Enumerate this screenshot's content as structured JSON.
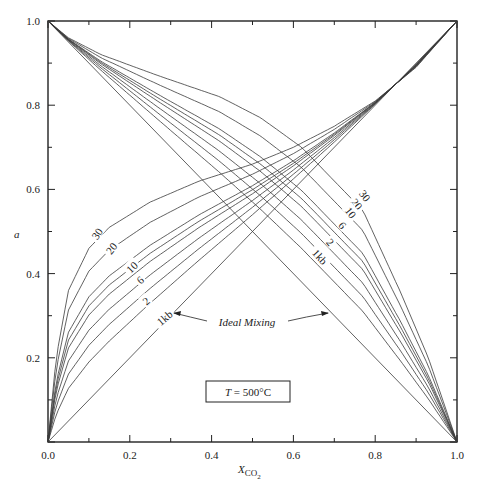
{
  "chart_data": {
    "type": "line",
    "title": "",
    "xlabel": "X_CO2",
    "xlabel_main": "X",
    "xlabel_sub": "CO",
    "xlabel_subsub": "2",
    "ylabel": "a",
    "xlim": [
      0.0,
      1.0
    ],
    "ylim": [
      0.0,
      1.0
    ],
    "x_ticks": [
      "0.0",
      "0.2",
      "0.4",
      "0.6",
      "0.8",
      "1.0"
    ],
    "y_ticks": [
      "0.2",
      "0.4",
      "0.6",
      "0.8",
      "1.0"
    ],
    "grid": false,
    "legend": null,
    "annotations": {
      "ideal_mixing": "Ideal Mixing",
      "temperature_box": "T = 500°C",
      "temperature_var": "T",
      "temperature_value": " = 500°C"
    },
    "ideal_mixing": {
      "ascending": [
        [
          0,
          0
        ],
        [
          1,
          1
        ]
      ],
      "descending": [
        [
          0,
          1
        ],
        [
          1,
          0
        ]
      ]
    },
    "reference_30kb": {
      "ascending": [
        [
          0,
          0
        ],
        [
          0.02,
          0.2
        ],
        [
          0.05,
          0.36
        ],
        [
          0.1,
          0.46
        ],
        [
          0.15,
          0.51
        ],
        [
          0.25,
          0.57
        ],
        [
          0.37,
          0.62
        ],
        [
          0.5,
          0.66
        ],
        [
          0.6,
          0.7
        ],
        [
          0.7,
          0.75
        ],
        [
          0.8,
          0.81
        ],
        [
          0.9,
          0.89
        ],
        [
          1,
          1
        ]
      ],
      "descending": [
        [
          0,
          1
        ],
        [
          0.05,
          0.96
        ],
        [
          0.13,
          0.92
        ],
        [
          0.27,
          0.87
        ],
        [
          0.42,
          0.82
        ],
        [
          0.52,
          0.77
        ],
        [
          0.62,
          0.7
        ],
        [
          0.7,
          0.62
        ],
        [
          0.77,
          0.55
        ],
        [
          0.86,
          0.36
        ],
        [
          0.93,
          0.2
        ],
        [
          1,
          0
        ]
      ]
    },
    "series": [
      {
        "name": "30",
        "pressure_kb": 30,
        "deviation_fraction": 1.0,
        "label": "30"
      },
      {
        "name": "20",
        "pressure_kb": 20,
        "deviation_fraction": 0.85,
        "label": "20"
      },
      {
        "name": "10",
        "pressure_kb": 10,
        "deviation_fraction": 0.68,
        "label": "10"
      },
      {
        "name": "8",
        "pressure_kb": 8,
        "deviation_fraction": 0.62,
        "label": ""
      },
      {
        "name": "6",
        "pressure_kb": 6,
        "deviation_fraction": 0.56,
        "label": "6"
      },
      {
        "name": "4",
        "pressure_kb": 4,
        "deviation_fraction": 0.46,
        "label": ""
      },
      {
        "name": "2",
        "pressure_kb": 2,
        "deviation_fraction": 0.36,
        "label": "2"
      },
      {
        "name": "1kb",
        "pressure_kb": 1,
        "deviation_fraction": 0.25,
        "label": "1kb"
      }
    ],
    "left_labels": [
      {
        "text": "30",
        "x": 0.12,
        "y": 0.495,
        "rot": -55
      },
      {
        "text": "20",
        "x": 0.155,
        "y": 0.46,
        "rot": -52
      },
      {
        "text": "10",
        "x": 0.205,
        "y": 0.415,
        "rot": -45
      },
      {
        "text": "6",
        "x": 0.225,
        "y": 0.385,
        "rot": -42
      },
      {
        "text": "2",
        "x": 0.24,
        "y": 0.335,
        "rot": -40
      },
      {
        "text": "1kb",
        "x": 0.285,
        "y": 0.295,
        "rot": -40
      }
    ],
    "right_labels": [
      {
        "text": "30",
        "x": 0.775,
        "y": 0.585,
        "rot": 52
      },
      {
        "text": "20",
        "x": 0.755,
        "y": 0.565,
        "rot": 52
      },
      {
        "text": "10",
        "x": 0.74,
        "y": 0.545,
        "rot": 52
      },
      {
        "text": "6",
        "x": 0.72,
        "y": 0.515,
        "rot": 50
      },
      {
        "text": "2",
        "x": 0.69,
        "y": 0.475,
        "rot": 48
      },
      {
        "text": "1kb",
        "x": 0.665,
        "y": 0.44,
        "rot": 48
      }
    ]
  }
}
